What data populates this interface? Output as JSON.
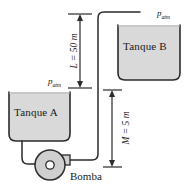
{
  "diagram": {
    "tanks": [
      {
        "id": "a",
        "label": "Tanque A"
      },
      {
        "id": "b",
        "label": "Tanque B"
      }
    ],
    "pressure_labels": [
      {
        "id": "patm-a",
        "symbol": "p",
        "subscript": "atm"
      },
      {
        "id": "patm-b",
        "symbol": "p",
        "subscript": "atm"
      }
    ],
    "dimensions": [
      {
        "id": "l",
        "symbol": "L",
        "equals": " = ",
        "value": "50",
        "unit": " m",
        "text": "L = 50 m"
      },
      {
        "id": "m",
        "symbol": "M",
        "equals": " = ",
        "value": "5",
        "unit": " m",
        "text": "M = 5 m"
      }
    ],
    "equipment": {
      "pump_label": "Bomba"
    },
    "colors": {
      "liquid_fill": "#d9d9d9",
      "tank_outline": "#2b2b2b",
      "pipe": "#2b2b2b",
      "pump_fill": "#cfcfcf",
      "background": "#ffffff",
      "text": "#1a1a1a"
    }
  }
}
